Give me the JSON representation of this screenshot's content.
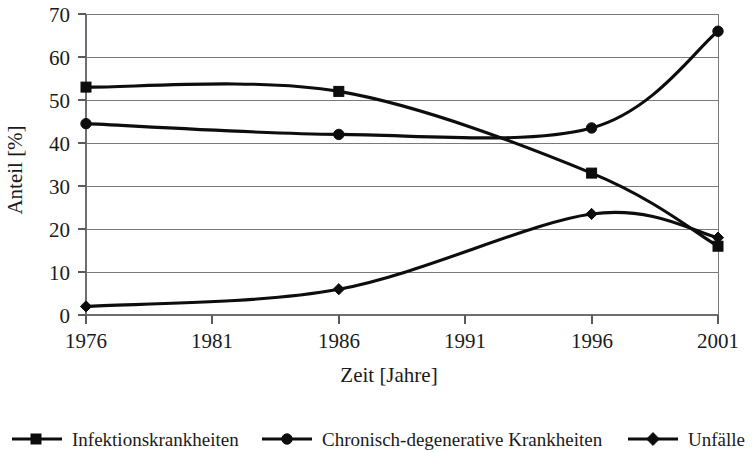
{
  "chart_data": {
    "type": "line",
    "title": "",
    "xlabel": "Zeit [Jahre]",
    "ylabel": "Anteil [%]",
    "x": [
      1976,
      1986,
      1996,
      2001
    ],
    "xlim": [
      1976,
      2001
    ],
    "ylim": [
      0,
      70
    ],
    "xticks": [
      "1976",
      "1981",
      "1986",
      "1991",
      "1996",
      "2001"
    ],
    "xtick_values": [
      1976,
      1981,
      1986,
      1991,
      1996,
      2001
    ],
    "yticks": [
      "0",
      "10",
      "20",
      "30",
      "40",
      "50",
      "60",
      "70"
    ],
    "ytick_values": [
      0,
      10,
      20,
      30,
      40,
      50,
      60,
      70
    ],
    "grid": "horizontal",
    "legend_position": "bottom",
    "interpolation": "smooth",
    "series": [
      {
        "name": "Infektionskrankheiten",
        "marker": "square",
        "color": "#0d0d0d",
        "values": [
          53,
          52,
          33,
          16
        ]
      },
      {
        "name": "Chronisch-degenerative Krankheiten",
        "marker": "circle",
        "color": "#0d0d0d",
        "values": [
          44.5,
          42,
          43.5,
          66
        ]
      },
      {
        "name": "Unfälle",
        "marker": "diamond",
        "color": "#0d0d0d",
        "values": [
          2,
          6,
          23.5,
          18
        ]
      }
    ]
  },
  "axes": {
    "y_axis_title": "Anteil [%]",
    "x_axis_title": "Zeit [Jahre]",
    "y_tick_labels": [
      "70",
      "60",
      "50",
      "40",
      "30",
      "20",
      "10",
      "0"
    ],
    "x_tick_labels": [
      "1976",
      "1981",
      "1986",
      "1991",
      "1996",
      "2001"
    ]
  },
  "legend": {
    "items": [
      {
        "label": "Infektionskrankheiten",
        "marker": "square"
      },
      {
        "label": "Chronisch-degenerative Krankheiten",
        "marker": "circle"
      },
      {
        "label": "Unfälle",
        "marker": "diamond"
      }
    ]
  },
  "colors": {
    "ink": "#0d0d0d",
    "grid": "#7a7a7a",
    "background": "#ffffff"
  }
}
